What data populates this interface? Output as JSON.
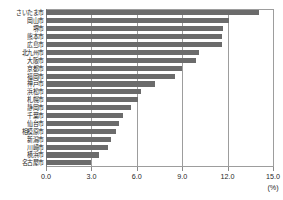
{
  "chart_data": {
    "type": "bar",
    "orientation": "horizontal",
    "title": "",
    "xlabel": "(%)",
    "ylabel": "",
    "xlim": [
      0.0,
      15.0
    ],
    "xticks": [
      "0.0",
      "3.0",
      "6.0",
      "9.0",
      "12.0",
      "15.0"
    ],
    "xtick_values": [
      0.0,
      3.0,
      6.0,
      9.0,
      12.0,
      15.0
    ],
    "grid": true,
    "legend": false,
    "bar_color": "#6b6b6b",
    "grid_color": "#9d9d9d",
    "categories": [
      "さいたま市",
      "岡山市",
      "堺市",
      "熊本市",
      "広島市",
      "北九州市",
      "大阪市",
      "京都市",
      "福岡市",
      "神戸市",
      "浜松市",
      "札幌市",
      "静岡市",
      "千葉市",
      "仙台市",
      "相模原市",
      "新潟市",
      "川崎市",
      "横浜市",
      "名古屋市"
    ],
    "values": [
      14.1,
      12.1,
      11.7,
      11.6,
      11.6,
      10.1,
      9.9,
      9.0,
      8.5,
      7.2,
      6.3,
      6.1,
      5.6,
      5.1,
      4.8,
      4.6,
      4.3,
      4.1,
      3.5,
      3.0
    ]
  }
}
